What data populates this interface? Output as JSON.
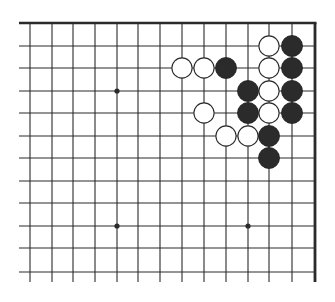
{
  "diagram": {
    "type": "go-board-fragment",
    "columns_x": [
      30,
      52,
      73,
      95,
      117,
      138,
      160,
      182,
      204,
      226,
      248,
      269,
      292
    ],
    "rows_y": [
      23,
      46,
      68,
      91,
      113,
      136,
      158,
      181,
      203,
      226,
      248,
      272
    ],
    "top_edge_y": 23,
    "right_edge_x": 315,
    "line_left_x": 19,
    "line_bottom_y": 282,
    "star_points": [
      {
        "col": 4,
        "row": 3
      },
      {
        "col": 4,
        "row": 9
      },
      {
        "col": 10,
        "row": 9
      }
    ],
    "stones": [
      {
        "color": "white",
        "col": 11,
        "row": 1
      },
      {
        "color": "black",
        "col": 12,
        "row": 1
      },
      {
        "color": "white",
        "col": 7,
        "row": 2
      },
      {
        "color": "white",
        "col": 8,
        "row": 2
      },
      {
        "color": "black",
        "col": 9,
        "row": 2
      },
      {
        "color": "white",
        "col": 11,
        "row": 2
      },
      {
        "color": "black",
        "col": 12,
        "row": 2
      },
      {
        "color": "black",
        "col": 10,
        "row": 3
      },
      {
        "color": "white",
        "col": 11,
        "row": 3
      },
      {
        "color": "black",
        "col": 12,
        "row": 3
      },
      {
        "color": "white",
        "col": 8,
        "row": 4
      },
      {
        "color": "black",
        "col": 10,
        "row": 4
      },
      {
        "color": "white",
        "col": 11,
        "row": 4
      },
      {
        "color": "black",
        "col": 12,
        "row": 4
      },
      {
        "color": "white",
        "col": 9,
        "row": 5
      },
      {
        "color": "white",
        "col": 10,
        "row": 5
      },
      {
        "color": "black",
        "col": 11,
        "row": 5
      },
      {
        "color": "black",
        "col": 11,
        "row": 6
      }
    ],
    "colors": {
      "line": "#2a2a2a",
      "black_stone": "#2b2b2b",
      "white_stone": "#ffffff",
      "background": "#ffffff"
    },
    "stone_radius": 10.5
  }
}
